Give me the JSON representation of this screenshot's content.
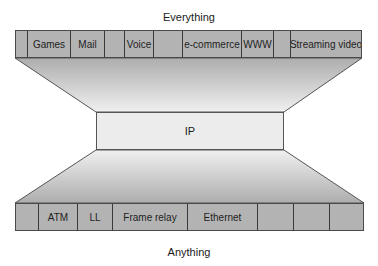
{
  "diagram": {
    "top_caption": "Everything",
    "bottom_caption": "Anything",
    "center_label": "IP",
    "top_bar": {
      "cells": [
        {
          "label": "",
          "width": 12
        },
        {
          "label": "Games",
          "width": 43
        },
        {
          "label": "Mail",
          "width": 34
        },
        {
          "label": "",
          "width": 20
        },
        {
          "label": "Voice",
          "width": 29
        },
        {
          "label": "",
          "width": 29
        },
        {
          "label": "e-commerce",
          "width": 59
        },
        {
          "label": "WWW",
          "width": 32
        },
        {
          "label": "",
          "width": 17
        },
        {
          "label": "Streaming video",
          "width": 72
        }
      ]
    },
    "bottom_bar": {
      "cells": [
        {
          "label": "",
          "width": 23
        },
        {
          "label": "ATM",
          "width": 39
        },
        {
          "label": "LL",
          "width": 35
        },
        {
          "label": "Frame relay",
          "width": 75
        },
        {
          "label": "Ethernet",
          "width": 70
        },
        {
          "label": "",
          "width": 36
        },
        {
          "label": "",
          "width": 36
        },
        {
          "label": "",
          "width": 35
        }
      ]
    },
    "colors": {
      "cell_fill": "#b3b3b3",
      "funnel_dark": "#b0b0b0",
      "funnel_light": "#f2f2f2",
      "ip_fill": "#ececec",
      "outline": "#4a4a4a"
    }
  }
}
